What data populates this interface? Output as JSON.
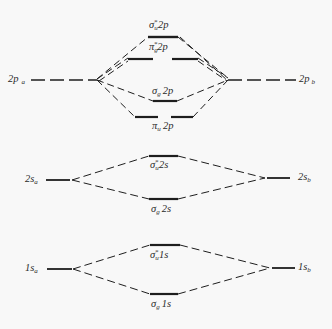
{
  "diagram": {
    "title": "",
    "type": "molecular-orbital-energy-diagram",
    "colors": {
      "line": "#1e1e1e",
      "text": "#2a2a2a",
      "background": "#f8f8f8"
    },
    "levels": {
      "p2": {
        "atomic_left": {
          "orbital": "2p",
          "atom": "a"
        },
        "atomic_right": {
          "orbital": "2p",
          "atom": "b"
        },
        "molecular": [
          {
            "sym": "σ",
            "sub": "u",
            "star": "*",
            "orbital": "2p",
            "kind": "antibonding"
          },
          {
            "sym": "π",
            "sub": "g",
            "star": "*",
            "orbital": "2p",
            "kind": "antibonding",
            "degenerate": 2
          },
          {
            "sym": "σ",
            "sub": "g",
            "star": "",
            "orbital": "2p",
            "kind": "bonding"
          },
          {
            "sym": "π",
            "sub": "u",
            "star": "",
            "orbital": "2p",
            "kind": "bonding",
            "degenerate": 2
          }
        ]
      },
      "s2": {
        "atomic_left": {
          "orbital": "2s",
          "atom": "a"
        },
        "atomic_right": {
          "orbital": "2s",
          "atom": "b"
        },
        "molecular": [
          {
            "sym": "σ",
            "sub": "u",
            "star": "*",
            "orbital": "2s",
            "kind": "antibonding"
          },
          {
            "sym": "σ",
            "sub": "g",
            "star": "",
            "orbital": "2s",
            "kind": "bonding"
          }
        ]
      },
      "s1": {
        "atomic_left": {
          "orbital": "1s",
          "atom": "a"
        },
        "atomic_right": {
          "orbital": "1s",
          "atom": "b"
        },
        "molecular": [
          {
            "sym": "σ",
            "sub": "u",
            "star": "*",
            "orbital": "1s",
            "kind": "antibonding"
          },
          {
            "sym": "σ",
            "sub": "g",
            "star": "",
            "orbital": "1s",
            "kind": "bonding"
          }
        ]
      }
    }
  }
}
